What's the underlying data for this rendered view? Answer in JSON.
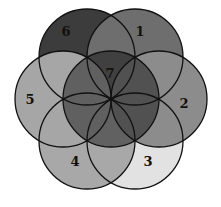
{
  "diagram": {
    "type": "seven-circle overlap (flower of life arrangement)",
    "radius": 48,
    "center": [
      111,
      99
    ],
    "circles": [
      {
        "label": "6",
        "cx": 87,
        "cy": 57,
        "fill": "#3c3c3c",
        "lx": 66,
        "ly": 36
      },
      {
        "label": "1",
        "cx": 135,
        "cy": 57,
        "fill": "#6e6e6e",
        "lx": 140,
        "ly": 36
      },
      {
        "label": "3",
        "cx": 135,
        "cy": 141,
        "fill": "#e2e2e2",
        "lx": 148,
        "ly": 166
      },
      {
        "label": "4",
        "cx": 87,
        "cy": 141,
        "fill": "#a8a8a8",
        "lx": 75,
        "ly": 166
      },
      {
        "label": "5",
        "cx": 63,
        "cy": 99,
        "fill": "#a6a6a6",
        "lx": 30,
        "ly": 104
      },
      {
        "label": "2",
        "cx": 159,
        "cy": 99,
        "fill": "#8c8c8c",
        "lx": 184,
        "ly": 108
      }
    ],
    "center_circle": {
      "label": "7",
      "cx": 111,
      "cy": 99,
      "lx": 110,
      "ly": 78
    }
  }
}
